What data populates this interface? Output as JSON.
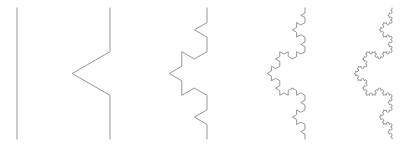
{
  "figure": {
    "name": "koch-curve-iterations",
    "background_color": "#ffffff",
    "stroke_color": "#8a8a8a",
    "stroke_width": 0.9,
    "canvas": {
      "width": 418,
      "height": 147
    },
    "panel_count": 5
  },
  "chart_data": {
    "type": "line",
    "subtitle": "",
    "xlabel": "",
    "ylabel": "",
    "grid": false,
    "legend": null,
    "axis_visible": false,
    "tick_labels": [],
    "annotations": [],
    "xlim": [
      0,
      418
    ],
    "ylim": [
      0,
      147
    ],
    "fractal": {
      "name": "Koch curve",
      "orientation": "vertical",
      "bump_direction": "left",
      "generator_rule": "replace each segment with 4 segments of 1/3 length, middle pair forming an equilateral triangle bump",
      "segment_counts": [
        1,
        4,
        16,
        64,
        256
      ],
      "scaling_factor": 0.3333333333,
      "bump_angle_degrees": 60,
      "hausdorff_dimension": 1.2619
    },
    "series": [
      {
        "name": "iteration-0",
        "iteration": 0,
        "segments": 1,
        "baseline_x": 17,
        "top_y": 8,
        "bottom_y": 139,
        "amplitude": 0
      },
      {
        "name": "iteration-1",
        "iteration": 1,
        "segments": 4,
        "baseline_x": 110,
        "top_y": 8,
        "bottom_y": 139,
        "amplitude": 38
      },
      {
        "name": "iteration-2",
        "iteration": 2,
        "segments": 16,
        "baseline_x": 207,
        "top_y": 8,
        "bottom_y": 139,
        "amplitude": 38
      },
      {
        "name": "iteration-3",
        "iteration": 3,
        "segments": 64,
        "baseline_x": 305,
        "top_y": 8,
        "bottom_y": 139,
        "amplitude": 38
      },
      {
        "name": "iteration-4",
        "iteration": 4,
        "segments": 256,
        "baseline_x": 392,
        "top_y": 8,
        "bottom_y": 139,
        "amplitude": 38
      }
    ]
  }
}
